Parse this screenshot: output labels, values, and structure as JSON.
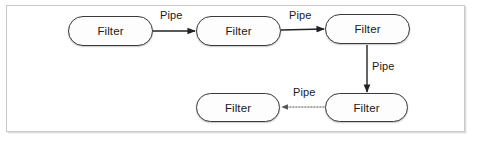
{
  "diagram": {
    "frame": {
      "border_color": "#c9c9c9",
      "background": "#ffffff"
    },
    "node_style": {
      "shape": "rounded-pill",
      "stroke_color": "#3a3a3a",
      "fill_color": "#fdfdfd",
      "text_color": "#1a1a1a"
    },
    "nodes": [
      {
        "id": "filter-1",
        "label": "Filter",
        "x": 68,
        "y": 16,
        "w": 85,
        "h": 30
      },
      {
        "id": "filter-2",
        "label": "Filter",
        "x": 196,
        "y": 16,
        "w": 85,
        "h": 30
      },
      {
        "id": "filter-3",
        "label": "Filter",
        "x": 325,
        "y": 14,
        "w": 85,
        "h": 30
      },
      {
        "id": "filter-4",
        "label": "Filter",
        "x": 325,
        "y": 93,
        "w": 83,
        "h": 29
      },
      {
        "id": "filter-5",
        "label": "Filter",
        "x": 196,
        "y": 93,
        "w": 84,
        "h": 29
      }
    ],
    "edges": [
      {
        "id": "pipe-1",
        "label": "Pipe",
        "from": "filter-1",
        "to": "filter-2",
        "style": "solid",
        "direction": "right",
        "label_x": 160,
        "label_y": 9
      },
      {
        "id": "pipe-2",
        "label": "Pipe",
        "from": "filter-2",
        "to": "filter-3",
        "style": "solid",
        "direction": "right",
        "label_x": 289,
        "label_y": 9
      },
      {
        "id": "pipe-3",
        "label": "Pipe",
        "from": "filter-3",
        "to": "filter-4",
        "style": "solid",
        "direction": "down",
        "label_x": 372,
        "label_y": 60
      },
      {
        "id": "pipe-4",
        "label": "Pipe",
        "from": "filter-4",
        "to": "filter-5",
        "style": "dotted",
        "direction": "left",
        "label_x": 293,
        "label_y": 86
      }
    ]
  }
}
